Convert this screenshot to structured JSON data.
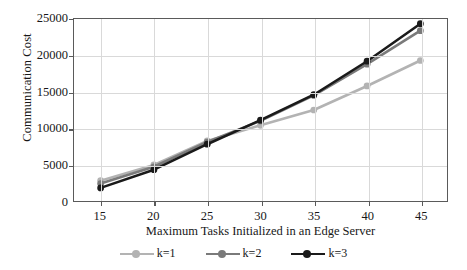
{
  "chart_data": {
    "type": "line",
    "title": "",
    "xlabel": "Maximum Tasks Initialized in an Edge Server",
    "ylabel": "Communication Cost",
    "x": [
      15,
      20,
      25,
      30,
      35,
      40,
      45
    ],
    "xticklabels": [
      "15",
      "20",
      "25",
      "30",
      "35",
      "40",
      "45"
    ],
    "yticklabels": [
      "0",
      "5000",
      "10000",
      "15000",
      "20000",
      "25000"
    ],
    "yticks": [
      0,
      5000,
      10000,
      15000,
      20000,
      25000
    ],
    "xlim": [
      12.5,
      47.5
    ],
    "ylim": [
      0,
      25000
    ],
    "grid": true,
    "legend_position": "bottom",
    "series": [
      {
        "name": "k=1",
        "color": "#b3b3b3",
        "values": [
          2800,
          4950,
          8250,
          10400,
          12500,
          15800,
          19300
        ]
      },
      {
        "name": "k=2",
        "color": "#7a7a7a",
        "values": [
          2400,
          4700,
          8100,
          11000,
          14500,
          18800,
          23400
        ]
      },
      {
        "name": "k=3",
        "color": "#1a1a1a",
        "values": [
          1800,
          4300,
          7800,
          11100,
          14600,
          19200,
          24350
        ]
      }
    ]
  },
  "axes": {
    "y_title": "Communication Cost",
    "x_title": "Maximum Tasks Initialized in an Edge Server"
  },
  "legend": {
    "items": [
      {
        "label": "k=1"
      },
      {
        "label": "k=2"
      },
      {
        "label": "k=3"
      }
    ]
  }
}
